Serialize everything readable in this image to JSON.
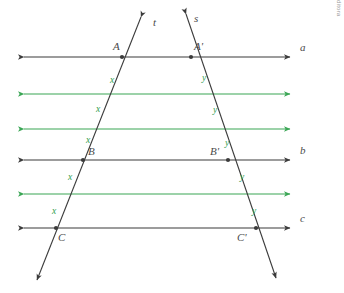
{
  "figure": {
    "colors": {
      "black_line": "#3b3b3b",
      "green_line": "#3aa655",
      "segment_label": "#2f9e4f",
      "point_label": "#4a4a4a",
      "background": "#ffffff"
    },
    "parallel_lines": [
      {
        "name": "line-a",
        "label": "a",
        "color": "#3b3b3b",
        "y": 57,
        "x1": 24,
        "x2": 290,
        "label_x": 300,
        "label_y": 51
      },
      {
        "name": "green-line-1",
        "label": "",
        "color": "#3aa655",
        "y": 94,
        "x1": 24,
        "x2": 290
      },
      {
        "name": "green-line-2",
        "label": "",
        "color": "#3aa655",
        "y": 129,
        "x1": 24,
        "x2": 290
      },
      {
        "name": "line-b",
        "label": "b",
        "color": "#3b3b3b",
        "y": 160,
        "x1": 24,
        "x2": 290,
        "label_x": 300,
        "label_y": 154
      },
      {
        "name": "green-line-3",
        "label": "",
        "color": "#3aa655",
        "y": 194,
        "x1": 24,
        "x2": 290
      },
      {
        "name": "line-c",
        "label": "c",
        "color": "#3b3b3b",
        "y": 228,
        "x1": 24,
        "x2": 290,
        "label_x": 300,
        "label_y": 222
      }
    ],
    "transversals": [
      {
        "name": "line-t",
        "label": "t",
        "x1": 141,
        "y1": 17,
        "x2": 37,
        "y2": 280,
        "label_x": 153,
        "label_y": 26
      },
      {
        "name": "line-s",
        "label": "s",
        "x1": 186,
        "y1": 14,
        "x2": 276,
        "y2": 278,
        "label_x": 194,
        "label_y": 22
      }
    ],
    "points": [
      {
        "name": "point-A",
        "label": "A",
        "x": 122,
        "y": 57,
        "label_x": 113,
        "label_y": 50
      },
      {
        "name": "point-A1",
        "label": "A'",
        "x": 191,
        "y": 57,
        "label_x": 194,
        "label_y": 50
      },
      {
        "name": "point-B",
        "label": "B",
        "x": 83,
        "y": 160,
        "label_x": 88,
        "label_y": 155
      },
      {
        "name": "point-B1",
        "label": "B'",
        "x": 228,
        "y": 160,
        "label_x": 210,
        "label_y": 155
      },
      {
        "name": "point-C",
        "label": "C",
        "x": 56,
        "y": 228,
        "label_x": 58,
        "label_y": 241
      },
      {
        "name": "point-C1",
        "label": "C'",
        "x": 256,
        "y": 228,
        "label_x": 237,
        "label_y": 241
      }
    ],
    "segment_labels": [
      {
        "name": "segment-label-x-1",
        "label": "x",
        "x": 110,
        "y": 83
      },
      {
        "name": "segment-label-x-2",
        "label": "x",
        "x": 96,
        "y": 112
      },
      {
        "name": "segment-label-x-3",
        "label": "x",
        "x": 86,
        "y": 143
      },
      {
        "name": "segment-label-x-4",
        "label": "x",
        "x": 68,
        "y": 180
      },
      {
        "name": "segment-label-x-5",
        "label": "x",
        "x": 52,
        "y": 214
      },
      {
        "name": "segment-label-y-1",
        "label": "y",
        "x": 202,
        "y": 81
      },
      {
        "name": "segment-label-y-2",
        "label": "y",
        "x": 213,
        "y": 113
      },
      {
        "name": "segment-label-y-3",
        "label": "y",
        "x": 225,
        "y": 146
      },
      {
        "name": "segment-label-y-4",
        "label": "y",
        "x": 240,
        "y": 180
      },
      {
        "name": "segment-label-y-5",
        "label": "y",
        "x": 252,
        "y": 214
      }
    ]
  },
  "credit": {
    "text": "Banco de imagens/Arquivo da editora"
  }
}
